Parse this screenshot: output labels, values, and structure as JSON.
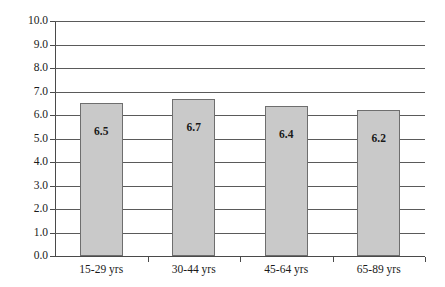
{
  "chart_data": {
    "type": "bar",
    "title": "",
    "subtitle": "",
    "xlabel": "",
    "ylabel": "",
    "categories": [
      "15-29 yrs",
      "30-44 yrs",
      "45-64 yrs",
      "65-89 yrs"
    ],
    "values": [
      6.5,
      6.7,
      6.4,
      6.2
    ],
    "value_labels": [
      "6.5",
      "6.7",
      "6.4",
      "6.2"
    ],
    "ylim": [
      0.0,
      10.0
    ],
    "ytick_step": 1.0,
    "ytick_labels": [
      "10.0",
      "9.0",
      "8.0",
      "7.0",
      "6.0",
      "5.0",
      "4.0",
      "3.0",
      "2.0",
      "1.0",
      "0.0"
    ],
    "ytick_values": [
      10.0,
      9.0,
      8.0,
      7.0,
      6.0,
      5.0,
      4.0,
      3.0,
      2.0,
      1.0,
      0.0
    ],
    "grid": true,
    "grid_axis": "y",
    "legend": false,
    "legend_position": "none",
    "bar_fill_color": "#c9c9c9",
    "bar_border_color": "#6e6e6e",
    "grid_color": "#5a5a5a",
    "axis_color": "#4a4a4a",
    "text_color": "#1a1a1a",
    "background_color": "#ffffff",
    "value_labels_inside_bars": true
  }
}
